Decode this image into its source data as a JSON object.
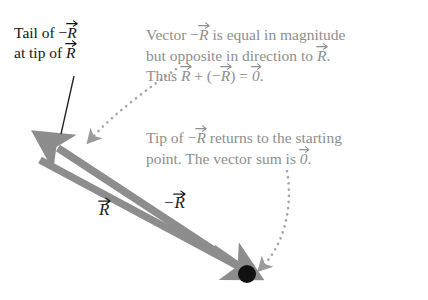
{
  "figure": {
    "background_color": "#ffffff"
  },
  "colors": {
    "arrow_gray": "#8d8d8d",
    "arrow_gray_dark": "#7e7e7e",
    "text_gray": "#8e8e8e",
    "text_black": "#141414",
    "dot_black": "#111111",
    "dotted_gray": "#a8a8a8",
    "pointer_line": "#1a1a1a"
  },
  "callouts": {
    "tail_label": {
      "line1_prefix": "Tail of ",
      "line1_vec_sign": "−",
      "line1_vec_letter": "R",
      "line2_prefix": "at tip of ",
      "line2_vec_letter": "R"
    },
    "magnitude_note": {
      "line1_a": "Vector ",
      "line1_sign": "−",
      "line1_letter": "R",
      "line1_b": " is equal in magnitude",
      "line2_a": "but opposite in direction to ",
      "line2_letter": "R",
      "line2_b": ".",
      "line3_a": "Thus ",
      "line3_letter1": "R",
      "line3_b": " + (",
      "line3_sign": "−",
      "line3_letter2": "R",
      "line3_c": ") = ",
      "line3_zero": "0",
      "line3_d": "."
    },
    "tip_note": {
      "line1_a": "Tip of ",
      "line1_sign": "−",
      "line1_letter": "R",
      "line1_b": " returns to the starting",
      "line2_a": "point. The vector sum is ",
      "line2_zero": "0",
      "line2_b": "."
    }
  },
  "vectors": [
    {
      "name": "R",
      "label_letter": "R",
      "label_sign": "",
      "direction": "up-left",
      "tail_x": 247,
      "tail_y": 273,
      "tip_x": 52,
      "tip_y": 145
    },
    {
      "name": "minus-R",
      "label_letter": "R",
      "label_sign": "−",
      "direction": "down-right",
      "tail_x": 40,
      "tail_y": 160,
      "tip_x": 243,
      "tip_y": 269
    }
  ],
  "markers": {
    "origin_dot": {
      "label": "starting point",
      "x": 247,
      "y": 274,
      "radius": 9
    }
  },
  "connectors": [
    {
      "name": "tail-pointer-line",
      "type": "solid",
      "from_x": 74,
      "from_y": 76,
      "to_x": 61,
      "to_y": 134
    },
    {
      "name": "magnitude-note-dotted-arrow",
      "type": "dotted",
      "from_x": 176,
      "from_y": 69,
      "to_x": 87,
      "to_y": 143
    },
    {
      "name": "tip-note-dotted-arrow",
      "type": "dotted",
      "from_x": 287,
      "from_y": 171,
      "to_x": 259,
      "to_y": 271
    }
  ]
}
